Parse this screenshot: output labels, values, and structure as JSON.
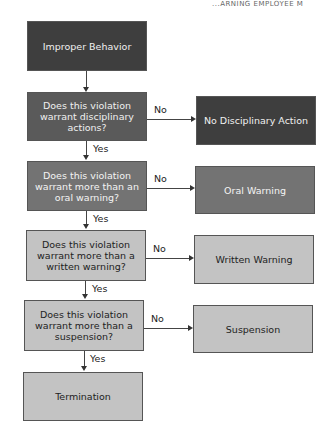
{
  "header": {
    "fragment": "...ARNING EMPLOYEE M"
  },
  "flowchart": {
    "start": "Improper Behavior",
    "questions": [
      "Does this violation warrant disciplinary actions?",
      "Does this violation warrant more than an oral warning?",
      "Does this violation warrant more than a written warning?",
      "Does this violation warrant more than a suspension?"
    ],
    "outcomes": [
      "No Disciplinary Action",
      "Oral Warning",
      "Written Warning",
      "Suspension"
    ],
    "final": "Termination",
    "yes_label": "Yes",
    "no_label": "No"
  }
}
